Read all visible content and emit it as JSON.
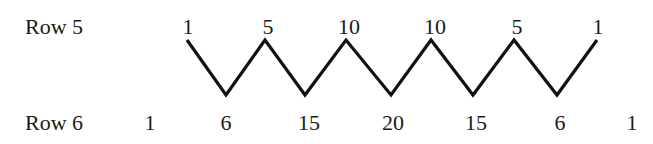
{
  "rows": [
    {
      "label": "Row 5",
      "values": [
        "1",
        "5",
        "10",
        "10",
        "5",
        "1"
      ]
    },
    {
      "label": "Row 6",
      "values": [
        "1",
        "6",
        "15",
        "20",
        "15",
        "6",
        "1"
      ]
    }
  ],
  "line_color": "#111111"
}
